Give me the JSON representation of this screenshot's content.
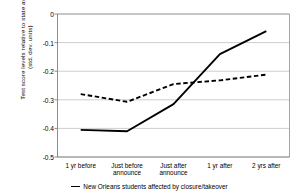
{
  "chart_data": {
    "type": "line",
    "title": "",
    "xlabel": "",
    "ylabel": "Test score levels relative to state avg\n(std. dev. units)",
    "categories": [
      "1 yr before",
      "Just before\nannounce",
      "Just after\nannounce",
      "1 yr after",
      "2 yrs after"
    ],
    "ylim": [
      -0.5,
      0
    ],
    "yticks": [
      "0",
      "-0.1",
      "-0.2",
      "-0.3",
      "-0.4",
      "-0.5"
    ],
    "ytick_values": [
      0,
      -0.1,
      -0.2,
      -0.3,
      -0.4,
      -0.5
    ],
    "grid": true,
    "grid_axis": "y",
    "legend_position": "bottom",
    "series": [
      {
        "name": "New Orleans students affected by closure/takeover",
        "style": "solid",
        "color": "#000000",
        "values": [
          -0.405,
          -0.41,
          -0.315,
          -0.14,
          -0.06
        ]
      },
      {
        "name": "",
        "style": "dashed",
        "color": "#000000",
        "values": [
          -0.28,
          -0.307,
          -0.245,
          -0.232,
          -0.212
        ]
      }
    ]
  },
  "legend": {
    "entries": [
      {
        "marker": "solid-line",
        "label": "New Orleans students affected by closure/takeover"
      }
    ]
  },
  "colors": {
    "line": "#000000",
    "grid": "#b8b8b8",
    "axis": "#808080",
    "background": "#ffffff"
  }
}
